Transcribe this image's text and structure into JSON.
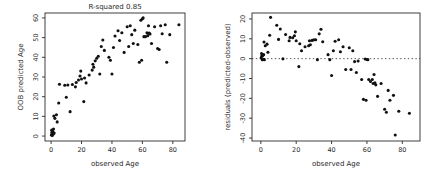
{
  "figure": {
    "background": "#ffffff",
    "point_color": "#111111",
    "axis_color": "#2a2a2a",
    "text_color": "#2a2a2a"
  },
  "chart_data": [
    {
      "id": "left",
      "type": "scatter",
      "title": "R-squared 0.85",
      "xlabel": "observed Age",
      "ylabel": "OOB predicted Age",
      "xlim": [
        -4,
        88
      ],
      "ylim": [
        -2.5,
        62.5
      ],
      "xticks": [
        0,
        20,
        40,
        60,
        80
      ],
      "yticks": [
        0,
        10,
        20,
        30,
        40,
        50,
        60
      ],
      "grid": false,
      "legend": null,
      "points": [
        [
          0.2,
          0.6
        ],
        [
          0.5,
          1.8
        ],
        [
          0.8,
          0.3
        ],
        [
          1.0,
          2.4
        ],
        [
          1.4,
          1.0
        ],
        [
          0.4,
          3.0
        ],
        [
          1.6,
          3.6
        ],
        [
          2.0,
          1.5
        ],
        [
          1.8,
          10.2
        ],
        [
          2.5,
          9.0
        ],
        [
          3.5,
          10.8
        ],
        [
          4.0,
          7.2
        ],
        [
          5.0,
          16.8
        ],
        [
          5.5,
          26.3
        ],
        [
          9.0,
          25.8
        ],
        [
          10.0,
          19.7
        ],
        [
          11.0,
          25.9
        ],
        [
          12.5,
          12.4
        ],
        [
          14.0,
          26.2
        ],
        [
          16.0,
          25.0
        ],
        [
          16.5,
          27.2
        ],
        [
          18.0,
          28.5
        ],
        [
          19.0,
          30.5
        ],
        [
          19.5,
          33.0
        ],
        [
          20.0,
          29.0
        ],
        [
          21.5,
          17.5
        ],
        [
          22.0,
          29.5
        ],
        [
          23.0,
          27.0
        ],
        [
          25.0,
          31.0
        ],
        [
          27.0,
          33.5
        ],
        [
          27.5,
          36.5
        ],
        [
          28.0,
          35.0
        ],
        [
          29.0,
          38.2
        ],
        [
          30.0,
          39.5
        ],
        [
          31.0,
          40.5
        ],
        [
          32.0,
          31.5
        ],
        [
          33.0,
          45.5
        ],
        [
          34.0,
          48.8
        ],
        [
          35.0,
          43.5
        ],
        [
          38.0,
          40.0
        ],
        [
          39.0,
          38.5
        ],
        [
          40.0,
          31.5
        ],
        [
          41.0,
          45.0
        ],
        [
          42.0,
          50.8
        ],
        [
          44.0,
          53.5
        ],
        [
          45.0,
          48.5
        ],
        [
          46.5,
          52.5
        ],
        [
          48.0,
          42.5
        ],
        [
          50.0,
          55.5
        ],
        [
          51.0,
          45.5
        ],
        [
          52.0,
          56.0
        ],
        [
          53.0,
          51.5
        ],
        [
          54.0,
          47.0
        ],
        [
          55.0,
          53.8
        ],
        [
          57.0,
          46.5
        ],
        [
          58.0,
          37.5
        ],
        [
          59.5,
          38.5
        ],
        [
          59.0,
          58.8
        ],
        [
          60.0,
          59.6
        ],
        [
          60.5,
          60.0
        ],
        [
          61.0,
          50.5
        ],
        [
          62.0,
          50.5
        ],
        [
          63.0,
          52.5
        ],
        [
          63.5,
          51.0
        ],
        [
          64.0,
          56.0
        ],
        [
          64.5,
          52.3
        ],
        [
          65.0,
          51.8
        ],
        [
          66.0,
          47.0
        ],
        [
          68.0,
          55.5
        ],
        [
          70.0,
          44.5
        ],
        [
          71.0,
          44.0
        ],
        [
          72.0,
          56.0
        ],
        [
          73.0,
          52.0
        ],
        [
          75.0,
          56.5
        ],
        [
          76.0,
          37.5
        ],
        [
          78.0,
          51.5
        ],
        [
          84.0,
          56.5
        ]
      ]
    },
    {
      "id": "right",
      "type": "scatter",
      "title": "",
      "xlabel": "observed Age",
      "ylabel": "residuals (predicted-observed)",
      "xlim": [
        -5,
        90
      ],
      "ylim": [
        -41.5,
        23
      ],
      "xticks": [
        0,
        20,
        40,
        60,
        80
      ],
      "yticks": [
        -40,
        -30,
        -20,
        -10,
        0,
        10,
        20
      ],
      "grid": false,
      "legend": null,
      "reference_line": {
        "y": 0,
        "style": "dotted"
      },
      "points": [
        [
          0.2,
          0.4
        ],
        [
          0.5,
          1.3
        ],
        [
          0.8,
          -0.5
        ],
        [
          1.0,
          1.4
        ],
        [
          1.4,
          -0.4
        ],
        [
          0.4,
          2.6
        ],
        [
          1.6,
          2.0
        ],
        [
          2.0,
          -0.5
        ],
        [
          1.8,
          8.4
        ],
        [
          2.5,
          6.5
        ],
        [
          3.5,
          7.3
        ],
        [
          4.0,
          3.2
        ],
        [
          5.0,
          11.8
        ],
        [
          5.5,
          20.8
        ],
        [
          9.0,
          16.8
        ],
        [
          10.0,
          9.7
        ],
        [
          11.0,
          14.9
        ],
        [
          12.5,
          -0.1
        ],
        [
          14.0,
          12.2
        ],
        [
          16.0,
          9.0
        ],
        [
          16.5,
          10.7
        ],
        [
          18.0,
          10.5
        ],
        [
          19.0,
          11.5
        ],
        [
          19.5,
          13.5
        ],
        [
          20.0,
          9.0
        ],
        [
          21.5,
          -4.0
        ],
        [
          22.0,
          7.5
        ],
        [
          23.0,
          4.0
        ],
        [
          25.0,
          6.0
        ],
        [
          27.0,
          6.5
        ],
        [
          27.5,
          9.0
        ],
        [
          28.0,
          7.0
        ],
        [
          29.0,
          9.2
        ],
        [
          30.0,
          9.5
        ],
        [
          31.0,
          9.5
        ],
        [
          32.0,
          -0.5
        ],
        [
          33.0,
          12.5
        ],
        [
          34.0,
          14.8
        ],
        [
          35.0,
          8.5
        ],
        [
          38.0,
          2.0
        ],
        [
          39.0,
          -0.5
        ],
        [
          40.0,
          -8.5
        ],
        [
          41.0,
          4.0
        ],
        [
          42.0,
          8.8
        ],
        [
          44.0,
          9.5
        ],
        [
          45.0,
          3.5
        ],
        [
          46.5,
          6.0
        ],
        [
          48.0,
          -5.5
        ],
        [
          50.0,
          5.5
        ],
        [
          51.0,
          -5.5
        ],
        [
          52.0,
          4.0
        ],
        [
          53.0,
          -1.5
        ],
        [
          54.0,
          -7.0
        ],
        [
          55.0,
          -1.2
        ],
        [
          57.0,
          -10.5
        ],
        [
          58.0,
          -20.5
        ],
        [
          59.5,
          -21.0
        ],
        [
          59.0,
          -0.2
        ],
        [
          60.0,
          -0.4
        ],
        [
          60.5,
          -0.5
        ],
        [
          61.0,
          -10.5
        ],
        [
          62.0,
          -11.5
        ],
        [
          63.0,
          -10.5
        ],
        [
          63.5,
          -12.5
        ],
        [
          64.0,
          -8.0
        ],
        [
          64.5,
          -12.2
        ],
        [
          65.0,
          -13.2
        ],
        [
          66.0,
          -19.0
        ],
        [
          68.0,
          -12.5
        ],
        [
          70.0,
          -25.5
        ],
        [
          71.0,
          -27.0
        ],
        [
          72.0,
          -16.0
        ],
        [
          73.0,
          -21.0
        ],
        [
          75.0,
          -18.5
        ],
        [
          76.0,
          -38.5
        ],
        [
          78.0,
          -26.5
        ],
        [
          84.0,
          -27.5
        ]
      ]
    }
  ]
}
